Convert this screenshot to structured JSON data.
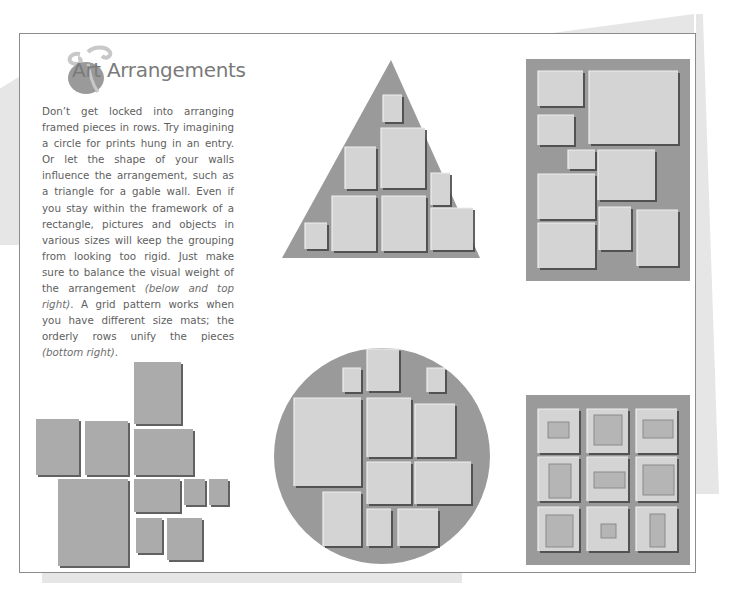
{
  "article": {
    "title": "Art Arrangements",
    "body_parts": [
      {
        "text": "Don’t get locked into arranging framed pieces in rows. Try imagining a circle for prints hung in an entry. Or let the shape of your walls influence the arrangement, such as a triangle for a gable wall. Even if you stay within the framework of a rectangle, pictures and objects in various sizes will keep the grouping from looking too rigid. Just make sure to balance the visual weight of the arrangement ",
        "italic": false
      },
      {
        "text": "(below and top right)",
        "italic": true
      },
      {
        "text": ". A grid pattern works when you have different size mats; the orderly rows unify the pieces ",
        "italic": false
      },
      {
        "text": "(bottom right)",
        "italic": true
      },
      {
        "text": ".",
        "italic": false
      }
    ]
  },
  "colors": {
    "backdrop": "#9a9a9a",
    "frame": "#d4d4d4",
    "frame_edge": "#eeeeee",
    "shadow": "#555555",
    "loose_frame": "#ababab",
    "mat_inner": "#b5b5b5",
    "page_border": "#8c8c8c"
  },
  "illustrations": {
    "triangle": {
      "label": "Triangle arrangement",
      "shape": [
        [
          391,
          60
        ],
        [
          282,
          258
        ],
        [
          480,
          258
        ]
      ],
      "frames": [
        [
          383,
          95,
          19,
          27
        ],
        [
          381,
          128,
          44,
          60
        ],
        [
          345,
          147,
          31,
          42
        ],
        [
          431,
          173,
          19,
          32
        ],
        [
          332,
          196,
          44,
          55
        ],
        [
          382,
          196,
          44,
          55
        ],
        [
          431,
          208,
          42,
          42
        ],
        [
          305,
          223,
          22,
          26
        ]
      ]
    },
    "rectangle": {
      "label": "Rectangle arrangement",
      "box": [
        526,
        59,
        164,
        222
      ],
      "frames": [
        [
          538,
          71,
          45,
          35
        ],
        [
          589,
          71,
          89,
          73
        ],
        [
          538,
          115,
          36,
          30
        ],
        [
          568,
          150,
          27,
          19
        ],
        [
          598,
          150,
          57,
          50
        ],
        [
          538,
          174,
          57,
          45
        ],
        [
          599,
          207,
          32,
          43
        ],
        [
          637,
          210,
          41,
          56
        ],
        [
          538,
          223,
          57,
          45
        ]
      ]
    },
    "loose": {
      "label": "Loose grouping",
      "frames": [
        [
          134,
          362,
          47,
          62
        ],
        [
          36,
          419,
          43,
          56
        ],
        [
          85,
          421,
          43,
          54
        ],
        [
          134,
          429,
          59,
          46
        ],
        [
          58,
          479,
          70,
          87
        ],
        [
          134,
          479,
          46,
          33
        ],
        [
          184,
          479,
          21,
          26
        ],
        [
          209,
          479,
          19,
          26
        ],
        [
          136,
          518,
          26,
          35
        ],
        [
          167,
          518,
          35,
          42
        ]
      ]
    },
    "circle": {
      "label": "Circle arrangement",
      "center": [
        382,
        456
      ],
      "radius": 108,
      "frames": [
        [
          343,
          368,
          18,
          24
        ],
        [
          367,
          349,
          32,
          42
        ],
        [
          427,
          368,
          18,
          24
        ],
        [
          294,
          398,
          67,
          88
        ],
        [
          367,
          398,
          44,
          59
        ],
        [
          415,
          404,
          40,
          53
        ],
        [
          367,
          462,
          44,
          42
        ],
        [
          415,
          462,
          56,
          42
        ],
        [
          323,
          492,
          38,
          54
        ],
        [
          367,
          509,
          24,
          37
        ],
        [
          398,
          509,
          40,
          37
        ]
      ]
    },
    "grid": {
      "label": "Grid arrangement",
      "box": [
        526,
        395,
        164,
        170
      ],
      "cells": [
        {
          "frame": [
            538,
            409,
            41,
            44
          ],
          "mat": [
            548,
            422,
            21,
            16
          ]
        },
        {
          "frame": [
            587,
            409,
            41,
            44
          ],
          "mat": [
            594,
            415,
            28,
            30
          ]
        },
        {
          "frame": [
            636,
            409,
            41,
            44
          ],
          "mat": [
            643,
            420,
            30,
            18
          ]
        },
        {
          "frame": [
            538,
            457,
            41,
            44
          ],
          "mat": [
            549,
            464,
            22,
            34
          ]
        },
        {
          "frame": [
            587,
            457,
            41,
            44
          ],
          "mat": [
            594,
            472,
            31,
            16
          ]
        },
        {
          "frame": [
            636,
            457,
            41,
            44
          ],
          "mat": [
            643,
            465,
            31,
            30
          ]
        },
        {
          "frame": [
            538,
            507,
            41,
            44
          ],
          "mat": [
            546,
            515,
            27,
            32
          ]
        },
        {
          "frame": [
            587,
            507,
            41,
            44
          ],
          "mat": [
            601,
            524,
            15,
            14
          ]
        },
        {
          "frame": [
            636,
            507,
            41,
            44
          ],
          "mat": [
            650,
            514,
            15,
            33
          ]
        }
      ]
    }
  }
}
